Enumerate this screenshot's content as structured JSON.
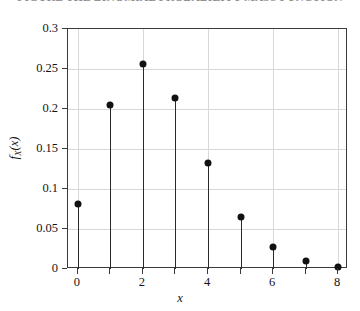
{
  "caption": {
    "text": "FIGURE  THE BINOMIAL PROBABILITY MASS FUNCTION"
  },
  "axis_label_y": {
    "f": "f",
    "subscript": "X",
    "arg": "(x)"
  },
  "axis_label_x": "x",
  "chart_data": {
    "type": "scatter",
    "style": "stem",
    "title": "",
    "subtitle": "",
    "xlabel": "x",
    "ylabel": "f_X(x)",
    "x": [
      0,
      1,
      2,
      3,
      4,
      5,
      6,
      7,
      8
    ],
    "values": [
      0.081,
      0.205,
      0.256,
      0.214,
      0.133,
      0.065,
      0.028,
      0.01,
      0.002
    ],
    "categories": [
      "0",
      "1",
      "2",
      "3",
      "4",
      "5",
      "6",
      "7",
      "8"
    ],
    "xlim": [
      -0.3,
      8.3
    ],
    "ylim": [
      0,
      0.3
    ],
    "xticks": [
      0,
      2,
      4,
      6,
      8
    ],
    "xtick_labels": [
      "0",
      "2",
      "4",
      "6",
      "8"
    ],
    "xticks_minor": [
      1,
      3,
      5,
      7
    ],
    "yticks": [
      0,
      0.05,
      0.1,
      0.15,
      0.2,
      0.25,
      0.3
    ],
    "ytick_labels": [
      "0",
      "0.05",
      "0.1",
      "0.15",
      "0.2",
      "0.25",
      "0.3"
    ],
    "grid": true,
    "grid_axes": "both",
    "legend": false,
    "legend_position": "none",
    "marker": "filled-circle",
    "marker_color": "#111111",
    "stem_color": "#2a2a2a",
    "grid_color": "#d8d8d8",
    "frame_color": "#3a3a3a",
    "background": "#ffffff"
  }
}
